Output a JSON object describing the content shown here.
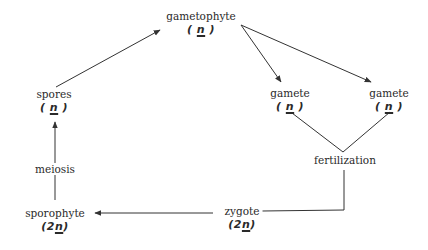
{
  "diagram": {
    "type": "life-cycle",
    "nodes": {
      "gametophyte": {
        "label": "gametophyte",
        "ploidy_prefix": "",
        "ploidy_n": "n"
      },
      "gamete_left": {
        "label": "gamete",
        "ploidy_prefix": "",
        "ploidy_n": "n"
      },
      "gamete_right": {
        "label": "gamete",
        "ploidy_prefix": "",
        "ploidy_n": "n"
      },
      "spores": {
        "label": "spores",
        "ploidy_prefix": "",
        "ploidy_n": "n"
      },
      "zygote": {
        "label": "zygote",
        "ploidy_prefix": "2",
        "ploidy_n": "n"
      },
      "sporophyte": {
        "label": "sporophyte",
        "ploidy_prefix": "2",
        "ploidy_n": "n"
      }
    },
    "processes": {
      "meiosis": "meiosis",
      "fertilization": "fertilization"
    },
    "edges": [
      {
        "from": "spores",
        "to": "gametophyte",
        "arrow": true
      },
      {
        "from": "gametophyte",
        "to": "gamete_left",
        "arrow": true
      },
      {
        "from": "gametophyte",
        "to": "gamete_right",
        "arrow": true
      },
      {
        "from": "gamete_left",
        "to": "fertilization",
        "arrow": false
      },
      {
        "from": "gamete_right",
        "to": "fertilization",
        "arrow": false
      },
      {
        "from": "fertilization",
        "to": "zygote",
        "arrow": false
      },
      {
        "from": "zygote",
        "to": "sporophyte",
        "arrow": true
      },
      {
        "from": "sporophyte",
        "to": "spores",
        "arrow": true,
        "via": "meiosis"
      }
    ],
    "colors": {
      "line": "#333333",
      "text": "#2a2a2a",
      "background": "#ffffff"
    }
  }
}
